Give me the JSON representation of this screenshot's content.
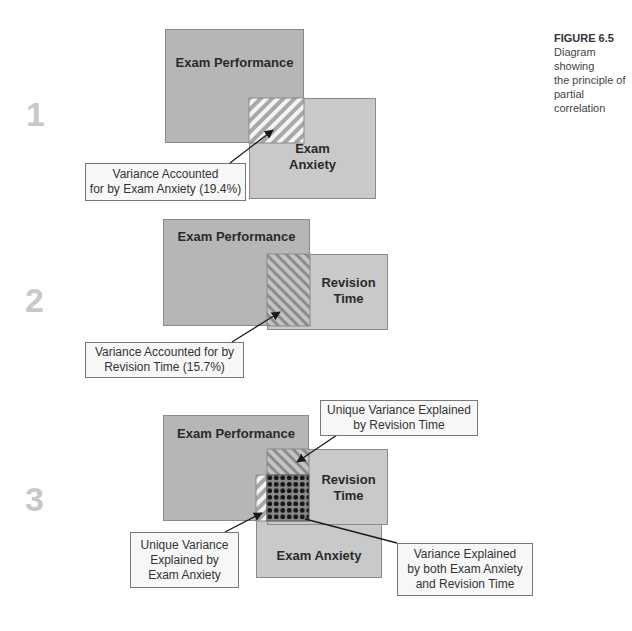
{
  "figure": {
    "title": "FIGURE 6.5",
    "caption_lines": [
      "Diagram showing",
      "the principle of",
      "partial correlation"
    ]
  },
  "panels": [
    {
      "step": "1",
      "boxes": {
        "exam_performance": "Exam Performance",
        "exam_anxiety_line1": "Exam",
        "exam_anxiety_line2": "Anxiety"
      },
      "label": {
        "line1": "Variance Accounted",
        "line2": "for by Exam Anxiety (19.4%)"
      }
    },
    {
      "step": "2",
      "boxes": {
        "exam_performance": "Exam Performance",
        "revision_time_line1": "Revision",
        "revision_time_line2": "Time"
      },
      "label": {
        "line1": "Variance Accounted for by",
        "line2": "Revision Time (15.7%)"
      }
    },
    {
      "step": "3",
      "boxes": {
        "exam_performance": "Exam Performance",
        "revision_time_line1": "Revision",
        "revision_time_line2": "Time",
        "exam_anxiety": "Exam Anxiety"
      },
      "labels": {
        "unique_revision": {
          "line1": "Unique Variance Explained",
          "line2": "by Revision Time"
        },
        "unique_anxiety": {
          "line1": "Unique Variance",
          "line2": "Explained by",
          "line3": "Exam Anxiety"
        },
        "shared": {
          "line1": "Variance Explained",
          "line2": "by both Exam Anxiety",
          "line3": "and Revision Time"
        }
      }
    }
  ],
  "colors": {
    "exam_performance_fill": "#b6b6b6",
    "secondary_fill": "#c9c9c9",
    "border": "#8a8a8a",
    "step_number": "#c8c8c8",
    "label_fill": "#f7f7f7"
  }
}
